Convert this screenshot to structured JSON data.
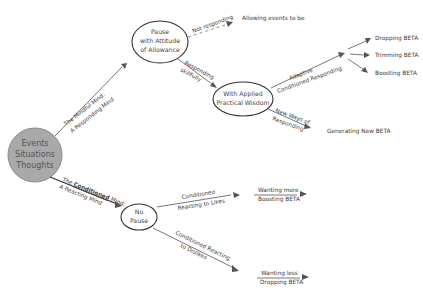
{
  "diagram": {
    "root": {
      "lines": [
        "Events",
        "Situations",
        "Thoughts"
      ],
      "fill": "#a9a9a9"
    },
    "nodes": {
      "pause": {
        "lines": [
          "Pause",
          "with Attitude",
          "of Allowance"
        ]
      },
      "wisdom": {
        "lines": [
          "With Applied",
          "Practical Wisdom"
        ]
      },
      "no_pause": {
        "lines": [
          "No",
          "Pause"
        ]
      }
    },
    "edges": {
      "mindful": {
        "top": "The Mindful Mind:",
        "bottom": "A Responding Mind"
      },
      "conditioned": {
        "top_prefix": "The ",
        "top_bold": "Conditioned",
        "top_suffix": " Mind:",
        "bottom": "A Reacting Mind"
      },
      "not_responding": {
        "label": "Not responding"
      },
      "responding_skillfully": {
        "top": "Responding",
        "bottom": "skillfully"
      },
      "adaptive": {
        "top": "Adaptive",
        "bottom": "Conditioned Responding"
      },
      "new_ways": {
        "top": "New Ways of",
        "bottom": "Responding"
      },
      "react_likes": {
        "top": "Conditioned",
        "bottom": "Reacting to Likes"
      },
      "react_dislikes": {
        "top": "Conditioned Reacting",
        "bottom": "to Dislikes"
      }
    },
    "leaves": {
      "allowing": "Allowing events to be",
      "dropping": "Dropping BETA",
      "trimming": "Trimming BETA",
      "boosting": "Boosting BETA",
      "generating": "Generating New BETA",
      "wanting_more": {
        "top": "Wanting more",
        "bottom": "Boosting BETA"
      },
      "wanting_less": {
        "top": "Wanting less",
        "bottom": "Dropping BETA"
      }
    }
  }
}
